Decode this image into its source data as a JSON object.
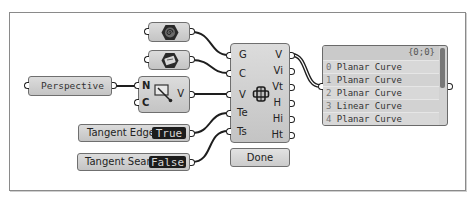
{
  "canvas": {
    "frame_color": "#8a8a8a",
    "wire_color": "#1e1e1e"
  },
  "nodes": {
    "geometry_param": {
      "icon": "hexagon-spiral-icon"
    },
    "curve_param": {
      "icon": "hexagon-card-icon"
    },
    "perspective_panel": {
      "text": "Perspective"
    },
    "perspective_component": {
      "inputs": [
        "N",
        "C"
      ],
      "outputs": [
        "V"
      ],
      "icon": "perspective-arrow-icon"
    },
    "main_component": {
      "inputs": [
        "G",
        "C",
        "V",
        "Te",
        "Ts"
      ],
      "outputs": [
        "V",
        "Vi",
        "Vt",
        "H",
        "Hi",
        "Ht"
      ],
      "icon": "silhouette-box-icon"
    },
    "done_button": {
      "label": "Done"
    },
    "tangent_edges": {
      "label": "Tangent Edges",
      "value": "True"
    },
    "tangent_seams": {
      "label": "Tangent Seams",
      "value": "False"
    }
  },
  "panel": {
    "path": "{0;0}",
    "rows": [
      {
        "index": "0",
        "text": "Planar Curve"
      },
      {
        "index": "1",
        "text": "Planar Curve"
      },
      {
        "index": "2",
        "text": "Planar Curve"
      },
      {
        "index": "3",
        "text": "Linear Curve"
      },
      {
        "index": "4",
        "text": "Planar Curve"
      }
    ]
  }
}
